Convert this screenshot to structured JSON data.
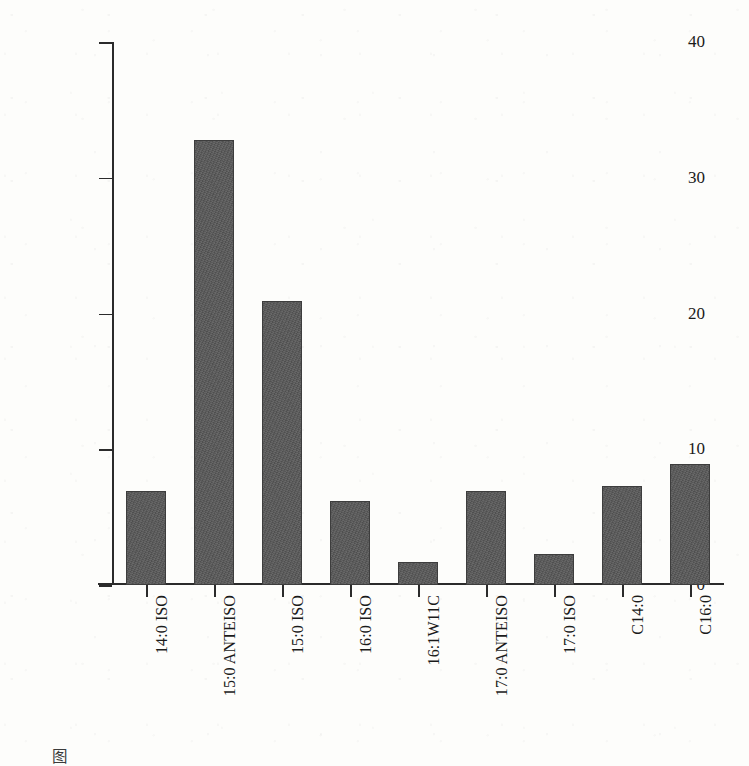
{
  "chart_data": {
    "type": "bar",
    "title": "",
    "xlabel": "",
    "ylabel": "脂肪酸含量/%",
    "ylim": [
      0,
      40
    ],
    "yticks": [
      0,
      10,
      20,
      30,
      40
    ],
    "ytick_labels": [
      "0",
      "10",
      "20",
      "30",
      "40"
    ],
    "grid": false,
    "legend": null,
    "bar_color": "#585858",
    "categories": [
      "14:0 ISO",
      "15:0 ANTEISO",
      "15:0 ISO",
      "16:0 ISO",
      "16:1W11C",
      "17:0 ANTEISO",
      "17:0 ISO",
      "C14:0",
      "C16:0"
    ],
    "values": [
      6.9,
      32.8,
      20.9,
      6.2,
      1.7,
      6.9,
      2.3,
      7.3,
      8.9
    ]
  },
  "caption": {
    "text": "图"
  },
  "colors": {
    "bar": "#585858",
    "bar_edge": "#3d3d3d",
    "axis": "#2b2b2b",
    "page_background": "#fdfdfb",
    "text": "#1a1a1a"
  }
}
